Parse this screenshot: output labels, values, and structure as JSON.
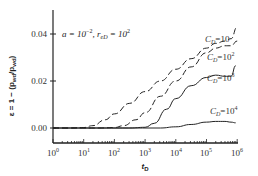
{
  "chart_data": {
    "type": "line",
    "title": "",
    "annotation": "a = 10^-2, r_eD = 10^2",
    "xlabel": "t_D",
    "ylabel": "ε = 1 − (p_wd / p_wd)",
    "xscale": "log",
    "xlim": [
      1,
      1000000
    ],
    "ylim": [
      -0.002,
      0.044
    ],
    "x_ticks": [
      "10^0",
      "10^1",
      "10^2",
      "10^3",
      "10^4",
      "10^5",
      "10^6"
    ],
    "y_ticks": [
      "0.00",
      "0.02",
      "0.04"
    ],
    "grid": false,
    "legend_position": "inline labels near curve ends (right)",
    "series": [
      {
        "name": "C_D=10",
        "x_log10": [
          0,
          0.5,
          1.0,
          1.3,
          1.7,
          2.0,
          2.5,
          3.0,
          3.5,
          4.0,
          4.5,
          5.0,
          5.3,
          5.6,
          5.8,
          6.0
        ],
        "values": [
          0.0,
          0.0,
          0.0002,
          0.001,
          0.0035,
          0.006,
          0.0105,
          0.0155,
          0.02,
          0.025,
          0.0295,
          0.034,
          0.036,
          0.037,
          0.038,
          0.043
        ]
      },
      {
        "name": "C_D=10^2",
        "x_log10": [
          0,
          1.5,
          2.0,
          2.3,
          2.7,
          3.0,
          3.5,
          4.0,
          4.5,
          5.0,
          5.3,
          5.6,
          5.8,
          6.0
        ],
        "values": [
          0.0,
          0.0,
          0.0002,
          0.001,
          0.0035,
          0.0065,
          0.0135,
          0.02,
          0.026,
          0.032,
          0.034,
          0.035,
          0.035,
          0.037
        ]
      },
      {
        "name": "C_D=10^3",
        "x_log10": [
          0,
          2.5,
          3.0,
          3.3,
          3.7,
          4.0,
          4.5,
          5.0,
          5.3,
          5.6,
          5.8,
          5.95
        ],
        "values": [
          0.0,
          0.0,
          0.0003,
          0.002,
          0.008,
          0.0125,
          0.018,
          0.0215,
          0.0225,
          0.022,
          0.022,
          0.0265
        ]
      },
      {
        "name": "C_D=10^4",
        "x_log10": [
          0,
          3.5,
          4.0,
          4.5,
          5.0,
          5.3,
          5.6,
          5.8,
          5.95
        ],
        "values": [
          0.0,
          0.0,
          0.0005,
          0.0015,
          0.0025,
          0.0028,
          0.0028,
          0.0025,
          0.0022
        ]
      }
    ]
  },
  "labels": {
    "annotation_a": "a = 10",
    "annotation_a_exp": "−2",
    "annotation_r": ", r",
    "annotation_r_sub": "eD",
    "annotation_r_eq": " = 10",
    "annotation_r_exp": "2",
    "xlabel": "t",
    "xlabel_sub": "D",
    "ylabel": "ε = 1 − (p",
    "ylabel_sub1": "wd",
    "ylabel_mid": "/p",
    "ylabel_sub2": "wd",
    "ylabel_end": ")",
    "ytick_0": "0.00",
    "ytick_1": "0.02",
    "ytick_2": "0.04",
    "xtick_base": "10",
    "xtick_exps": [
      "0",
      "1",
      "2",
      "3",
      "4",
      "5",
      "6"
    ],
    "cd": "C",
    "cd_sub": "D",
    "cd1": "=10",
    "cd2": "=10",
    "cd2_exp": "2",
    "cd3": "=10",
    "cd3_exp": "3",
    "cd4": "=10",
    "cd4_exp": "4"
  }
}
